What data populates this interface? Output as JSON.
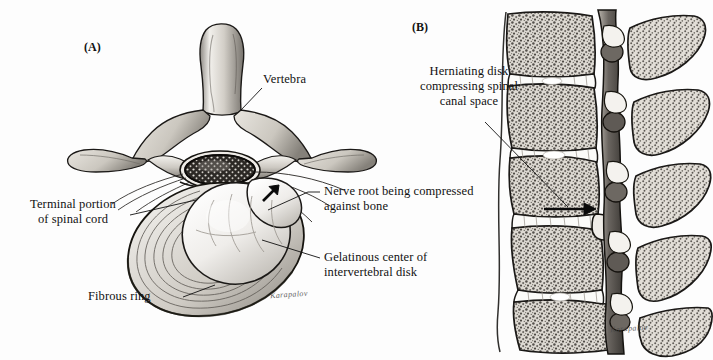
{
  "figure": {
    "background_color": "#fdfdfd",
    "ink_color": "#111111",
    "panels": [
      {
        "tag": "(A)",
        "x": 93,
        "y": 42
      },
      {
        "tag": "(B)",
        "x": 420,
        "y": 22
      }
    ]
  },
  "panel_a": {
    "tag": "(A)",
    "labels": {
      "vertebra": "Vertebra",
      "terminal_portion": "Terminal portion\nof spinal cord",
      "fibrous_ring": "Fibrous ring",
      "nerve_root": "Nerve root being compressed\nagainst bone",
      "gelatinous_center": "Gelatinous center of\nintervertebral disk"
    },
    "signature": "Karapalov",
    "arrow": {
      "direction": "up-right",
      "meaning": "herniation-direction"
    }
  },
  "panel_b": {
    "tag": "(B)",
    "labels": {
      "herniating_disk": "Herniating disk\ncompressing spinal\ncanal space"
    },
    "signature": "Karapalov",
    "arrow": {
      "direction": "right",
      "meaning": "disk-compressing-canal"
    },
    "vertebral_bodies_count": 5,
    "disks_count": 4
  },
  "colors": {
    "bone_light": "#e8e5df",
    "bone_mid": "#bdb8b0",
    "bone_dark": "#6e6a64",
    "outline": "#1a1a1a",
    "disk_white": "#fbfbf9",
    "cord_dark": "#2a2724"
  }
}
